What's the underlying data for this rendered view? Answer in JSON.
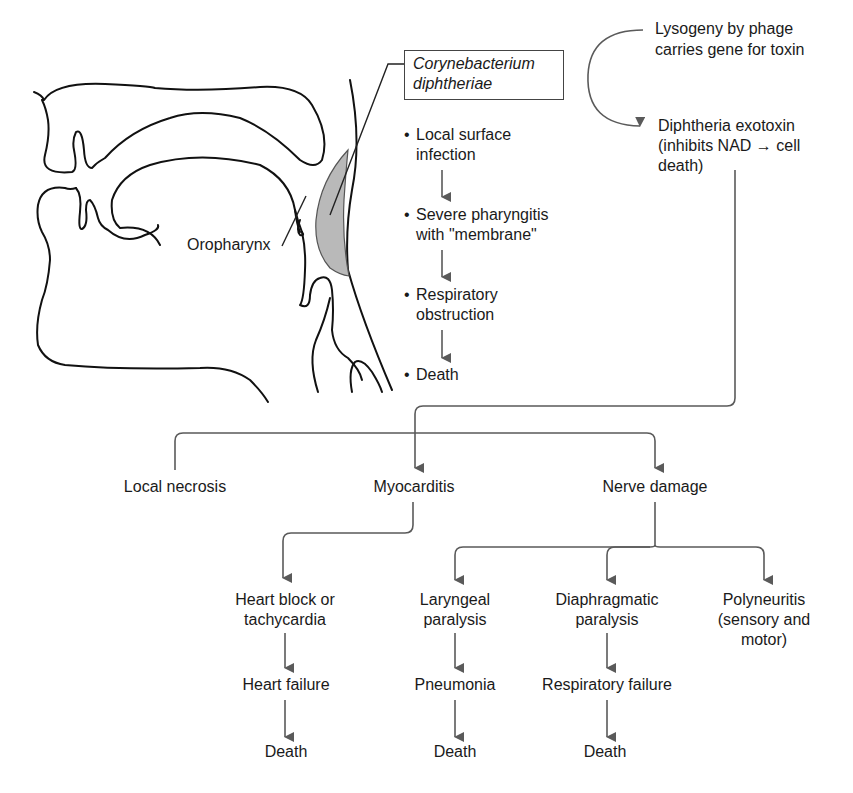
{
  "figure": {
    "organism_label_line1": "Corynebacterium",
    "organism_label_line2": "diphtheriae",
    "anatomy_label": "Oropharynx",
    "local_course": {
      "bullet": "•",
      "steps": [
        {
          "line1": "Local surface",
          "line2": "infection"
        },
        {
          "line1": "Severe pharyngitis",
          "line2": "with \"membrane\""
        },
        {
          "line1": "Respiratory",
          "line2": "obstruction"
        },
        {
          "line1": "Death",
          "line2": ""
        }
      ]
    },
    "phage": {
      "line1": "Lysogeny by phage",
      "line2": "carries gene for toxin"
    },
    "toxin": {
      "line1": "Diphtheria exotoxin",
      "line2": "(inhibits NAD → cell",
      "line3": "death)"
    },
    "systemic_effects": [
      {
        "label": "Local necrosis"
      },
      {
        "label": "Myocarditis"
      },
      {
        "label": "Nerve damage"
      }
    ],
    "myocarditis_branch": {
      "step1_line1": "Heart block or",
      "step1_line2": "tachycardia",
      "step2": "Heart failure",
      "step3": "Death"
    },
    "nerve_branches": [
      {
        "step1_line1": "Laryngeal",
        "step1_line2": "paralysis",
        "step2": "Pneumonia",
        "step3": "Death"
      },
      {
        "step1_line1": "Diaphragmatic",
        "step1_line2": "paralysis",
        "step2": "Respiratory failure",
        "step3": "Death"
      },
      {
        "step1_line1": "Polyneuritis",
        "step1_line2": "(sensory and",
        "step1_line3": "motor)"
      }
    ],
    "colors": {
      "anatomy_stroke": "#111111",
      "flow_arrow": "#5a5a5a",
      "membrane_fill": "#b9b9b9",
      "background": "#ffffff"
    }
  }
}
